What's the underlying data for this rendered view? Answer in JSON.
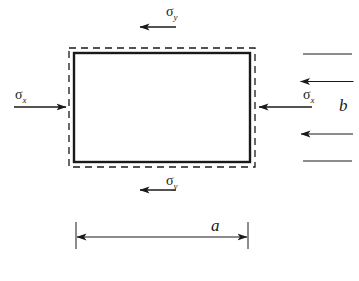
{
  "figure": {
    "type": "stress-element-diagram",
    "background_color": "#ffffff",
    "line_color": "#1a1a1a"
  },
  "plate": {
    "solid_rect": {
      "x": 74,
      "y": 53,
      "width": 176,
      "height": 109,
      "stroke_width": 2.4
    },
    "dashed_rect": {
      "x": 69,
      "y": 48,
      "width": 186,
      "height": 119,
      "stroke_width": 1.3,
      "dash": "7 5"
    }
  },
  "stresses": [
    {
      "id": "sigma-y-top",
      "symbol": "σ",
      "subscript": "y",
      "direction": "down",
      "label_x": 166,
      "label_y": 16
    },
    {
      "id": "sigma-x-left",
      "symbol": "σ",
      "subscript": "x",
      "direction": "right",
      "label_x": 15,
      "label_y": 99
    },
    {
      "id": "sigma-x-right",
      "symbol": "σ",
      "subscript": "x",
      "direction": "left",
      "label_x": 303,
      "label_y": 99
    },
    {
      "id": "sigma-y-bottom",
      "symbol": "σ",
      "subscript": "y",
      "direction": "up",
      "label_x": 166,
      "label_y": 185
    }
  ],
  "dimensions": [
    {
      "id": "dimension-a",
      "label": "a",
      "orientation": "horizontal",
      "label_x": 211,
      "label_y": 231
    },
    {
      "id": "dimension-b",
      "label": "b",
      "orientation": "vertical",
      "label_x": 339,
      "label_y": 111
    }
  ]
}
